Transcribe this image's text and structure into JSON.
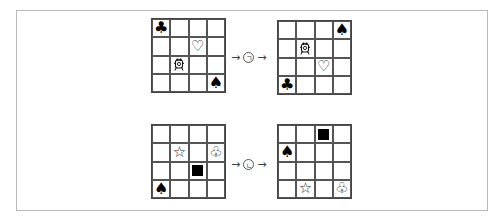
{
  "panels": [
    {
      "name": "before-1",
      "left": 151,
      "top": 18,
      "cells": [
        [
          "club-filled",
          "",
          "",
          ""
        ],
        [
          "",
          "",
          "heart-outline",
          ""
        ],
        [
          "",
          "figure",
          "",
          ""
        ],
        [
          "",
          "",
          "",
          "spade-filled"
        ]
      ]
    },
    {
      "name": "after-1",
      "left": 277,
      "top": 20,
      "cells": [
        [
          "",
          "",
          "",
          "spade-filled"
        ],
        [
          "",
          "figure",
          "",
          ""
        ],
        [
          "",
          "",
          "heart-outline",
          ""
        ],
        [
          "club-filled",
          "",
          "",
          ""
        ]
      ]
    },
    {
      "name": "before-2",
      "left": 151,
      "top": 124,
      "cells": [
        [
          "",
          "",
          "",
          ""
        ],
        [
          "",
          "star-outline",
          "",
          "club-outline"
        ],
        [
          "",
          "",
          "square-filled",
          ""
        ],
        [
          "spade-filled",
          "",
          "",
          ""
        ]
      ]
    },
    {
      "name": "after-2",
      "left": 277,
      "top": 124,
      "cells": [
        [
          "",
          "",
          "square-filled",
          ""
        ],
        [
          "spade-filled",
          "",
          "",
          ""
        ],
        [
          "",
          "",
          "",
          ""
        ],
        [
          "",
          "star-outline",
          "",
          "club-outline"
        ]
      ]
    }
  ],
  "transforms": [
    {
      "label": "ㄱ",
      "arrow_left": "→",
      "arrow_right": "→",
      "left": 231,
      "top": 51
    },
    {
      "label": "ㄴ",
      "arrow_left": "→",
      "arrow_right": "→",
      "left": 231,
      "top": 158
    }
  ],
  "glyphs": {
    "club-filled": "♣",
    "heart-outline": "♡",
    "spade-filled": "♠",
    "star-outline": "☆",
    "club-outline": "♧"
  }
}
